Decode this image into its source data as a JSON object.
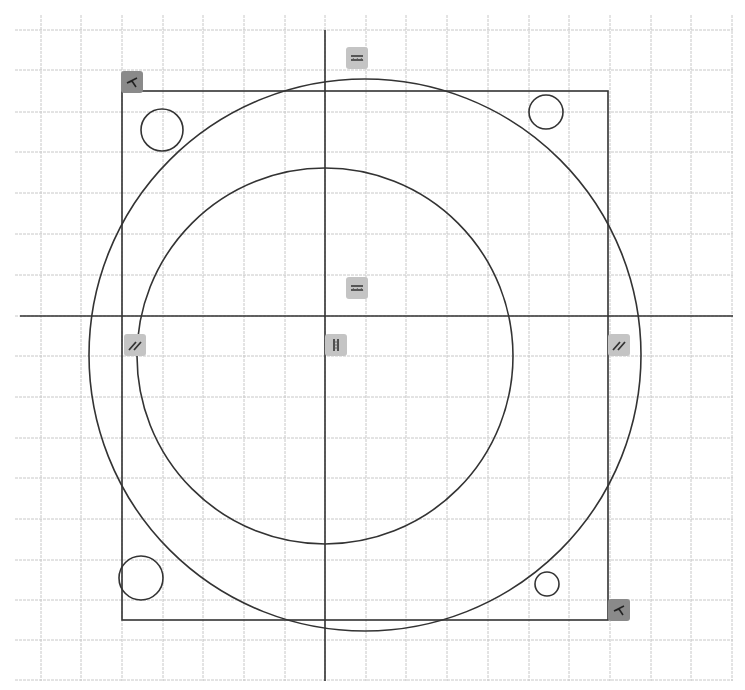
{
  "sketch": {
    "title": "Sketch constraint view",
    "colors": {
      "background": "#ffffff",
      "grid": "#c8c8c8",
      "geometry": "#333333",
      "glyph_bg_light": "#c4c4c4",
      "glyph_bg_dark": "#8a8a8a"
    },
    "grid": {
      "x_start": 15,
      "x_end": 733,
      "y_start": 15,
      "y_end": 681,
      "vertical_lines": [
        41,
        81,
        122,
        163,
        203,
        244,
        285,
        325,
        366,
        406,
        447,
        488,
        529,
        569,
        610,
        651,
        691,
        732
      ],
      "horizontal_lines": [
        30,
        70,
        112,
        152,
        193,
        234,
        275,
        316,
        356,
        397,
        438,
        478,
        519,
        560,
        600,
        640,
        680
      ]
    },
    "axes": {
      "horizontal": {
        "y": 316,
        "x1": 20,
        "x2": 733
      },
      "vertical": {
        "x": 325,
        "y1": 30,
        "y2": 681
      }
    },
    "rectangle": {
      "x": 122,
      "y": 91,
      "width": 486,
      "height": 529
    },
    "circles": [
      {
        "name": "outer-circle",
        "cx": 365,
        "cy": 355,
        "r": 276
      },
      {
        "name": "inner-circle",
        "cx": 325,
        "cy": 356,
        "r": 188
      },
      {
        "name": "hole-top-left",
        "cx": 162,
        "cy": 130,
        "r": 21
      },
      {
        "name": "hole-top-right",
        "cx": 546,
        "cy": 112,
        "r": 17
      },
      {
        "name": "hole-bottom-left",
        "cx": 141,
        "cy": 578,
        "r": 22
      },
      {
        "name": "hole-bottom-right",
        "cx": 547,
        "cy": 584,
        "r": 12
      }
    ],
    "constraints": [
      {
        "name": "coincident-top-left",
        "type": "coincident",
        "x": 132,
        "y": 82,
        "dark": true
      },
      {
        "name": "horizontal-top",
        "type": "horizontal",
        "x": 357,
        "y": 58,
        "dark": false
      },
      {
        "name": "horizontal-axis",
        "type": "horizontal",
        "x": 357,
        "y": 288,
        "dark": false
      },
      {
        "name": "parallel-left",
        "type": "parallel",
        "x": 135,
        "y": 345,
        "dark": false
      },
      {
        "name": "vertical-axis",
        "type": "vertical",
        "x": 336,
        "y": 345,
        "dark": false
      },
      {
        "name": "parallel-right",
        "type": "parallel",
        "x": 619,
        "y": 345,
        "dark": false
      },
      {
        "name": "coincident-bottom-right",
        "type": "coincident",
        "x": 619,
        "y": 610,
        "dark": true
      }
    ]
  }
}
